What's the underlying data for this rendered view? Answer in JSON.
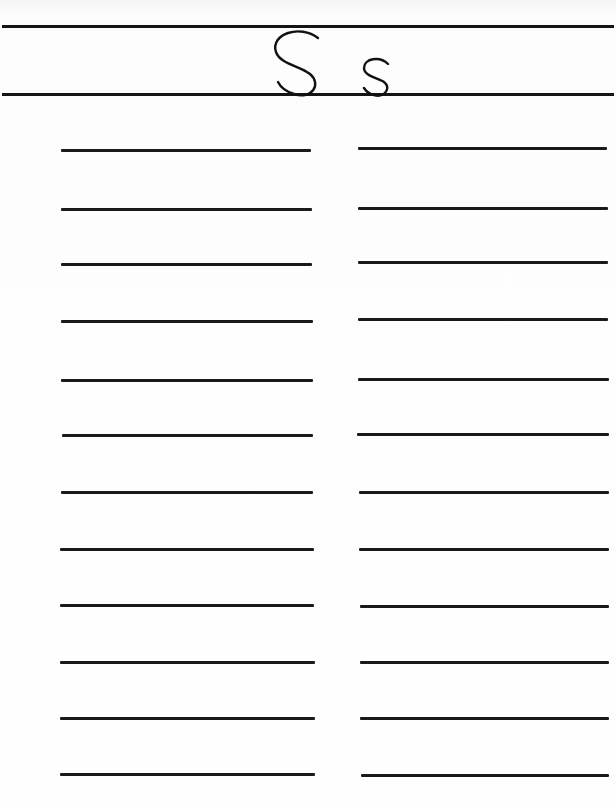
{
  "worksheet": {
    "title_upper": "S",
    "title_lower": "s",
    "left_column_lines": 12,
    "right_column_lines": 12,
    "line_y": [
      151,
      210,
      265,
      322,
      381,
      436,
      493,
      550,
      606,
      663,
      718,
      774
    ]
  }
}
